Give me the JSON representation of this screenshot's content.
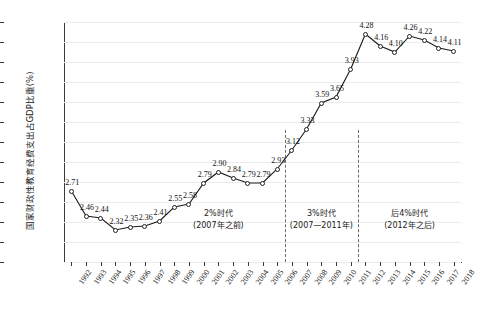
{
  "chart_data": {
    "type": "line",
    "title": "",
    "xlabel": "",
    "ylabel": "国家财政性教育经费支出占GDP比重(%)",
    "ylim": [
      2.0,
      4.4
    ],
    "ytick_step": 0.2,
    "grid": true,
    "legend": "none",
    "categories": [
      "1992",
      "1993",
      "1994",
      "1995",
      "1996",
      "1997",
      "1998",
      "1999",
      "2000",
      "2001",
      "2002",
      "2003",
      "2004",
      "2005",
      "2006",
      "2007",
      "2008",
      "2009",
      "2010",
      "2011",
      "2012",
      "2013",
      "2014",
      "2015",
      "2016",
      "2017",
      "2018"
    ],
    "values": [
      2.71,
      2.46,
      2.44,
      2.32,
      2.35,
      2.36,
      2.41,
      2.55,
      2.58,
      2.79,
      2.9,
      2.84,
      2.79,
      2.79,
      2.93,
      3.12,
      3.33,
      3.59,
      3.65,
      3.93,
      4.28,
      4.16,
      4.1,
      4.26,
      4.22,
      4.14,
      4.11
    ],
    "ytick_labels": [
      "2.00",
      "2.20",
      "2.40",
      "2.60",
      "2.80",
      "3.00",
      "3.20",
      "3.40",
      "3.60",
      "3.80",
      "4.00",
      "4.20",
      "4.40"
    ],
    "annotations": [
      {
        "name": "era-2-percent",
        "line1": "2%时代",
        "line2": "(2007年之前)",
        "center_year": "2002"
      },
      {
        "name": "era-3-percent",
        "line1": "3%时代",
        "line2": "(2007—2011年)",
        "center_year": "2009"
      },
      {
        "name": "era-post-4-percent",
        "line1": "后4%时代",
        "line2": "(2012年之后)",
        "center_year": "2015"
      }
    ],
    "dividers": [
      {
        "name": "divider-2007",
        "after_year": "2006"
      },
      {
        "name": "divider-2011",
        "after_year": "2011"
      }
    ],
    "colors": {
      "line": "#1a1a1a",
      "marker_fill": "#ffffff",
      "marker_stroke": "#222222",
      "grid": "#ececec",
      "axis": "#3a3a3a",
      "divider": "#6a6a6a",
      "background": "#ffffff"
    }
  }
}
